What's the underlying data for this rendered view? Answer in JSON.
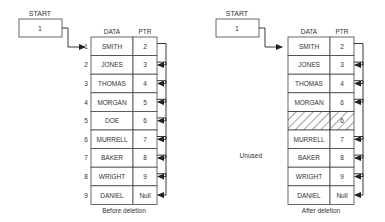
{
  "before": {
    "start_label": "START",
    "start_value": "1",
    "header_data": "DATA",
    "header_ptr": "PTR",
    "caption": "Before deletion",
    "rows": [
      {
        "index": "1",
        "data": "SMITH",
        "ptr": "2"
      },
      {
        "index": "2",
        "data": "JONES",
        "ptr": "3"
      },
      {
        "index": "3",
        "data": "THOMAS",
        "ptr": "4"
      },
      {
        "index": "4",
        "data": "MORGAN",
        "ptr": "5"
      },
      {
        "index": "5",
        "data": "DOE",
        "ptr": "6"
      },
      {
        "index": "6",
        "data": "MURRELL",
        "ptr": "7"
      },
      {
        "index": "7",
        "data": "BAKER",
        "ptr": "8"
      },
      {
        "index": "8",
        "data": "WRIGHT",
        "ptr": "9"
      },
      {
        "index": "9",
        "data": "DANIEL",
        "ptr": "Null"
      }
    ]
  },
  "after": {
    "start_label": "START",
    "start_value": "1",
    "header_data": "DATA",
    "header_ptr": "PTR",
    "caption": "After deletion",
    "unused_label": "Unused",
    "rows": [
      {
        "data": "SMITH",
        "ptr": "2"
      },
      {
        "data": "JONES",
        "ptr": "3"
      },
      {
        "data": "THOMAS",
        "ptr": "4"
      },
      {
        "data": "MORGAN",
        "ptr": "6"
      },
      {
        "data": "",
        "ptr": "6",
        "unused": true
      },
      {
        "data": "MURRELL",
        "ptr": "7"
      },
      {
        "data": "BAKER",
        "ptr": "8"
      },
      {
        "data": "WRIGHT",
        "ptr": "9"
      },
      {
        "data": "DANIEL",
        "ptr": "Null"
      }
    ]
  }
}
